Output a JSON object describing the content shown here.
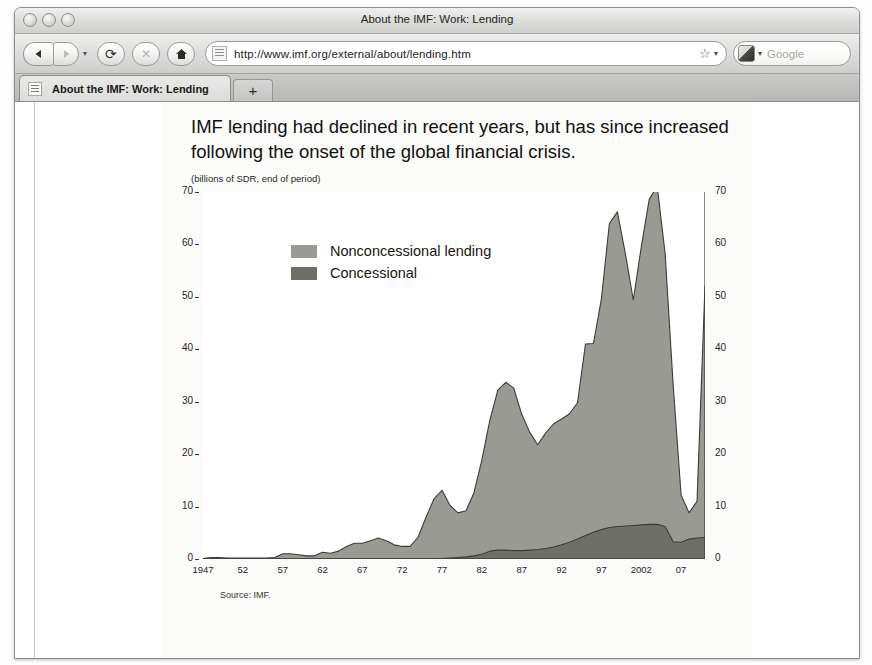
{
  "window": {
    "title": "About the IMF: Work: Lending",
    "buttons": [
      "close",
      "minimize",
      "zoom"
    ]
  },
  "toolbar": {
    "back_icon": "back-arrow-icon",
    "forward_icon": "forward-arrow-icon",
    "history_caret": "▾",
    "reload_label": "⟳",
    "stop_label": "✕",
    "home_label": "⌂",
    "url": "http://www.imf.org/external/about/lending.htm",
    "bookmark_icon": "☆",
    "bookmark_caret": "▾",
    "search_engine_caret": "▾",
    "search_placeholder": "Google"
  },
  "tabs": {
    "active": {
      "label": "About the IMF: Work: Lending"
    },
    "new_tab_label": "+"
  },
  "figure": {
    "title": "IMF lending had declined in recent years, but has since increased following the onset of the global financial crisis.",
    "subtitle": "(billions of SDR, end of period)",
    "source": "Source: IMF."
  },
  "colors": {
    "nonconcessional": "#9a9a95",
    "concessional": "#6f6f6a",
    "outline": "#3d3d38",
    "axis": "#3a3a34",
    "plot_background": "#ffffff",
    "figure_background": "#fbfbfa"
  },
  "chart_data": {
    "type": "area",
    "stacked": true,
    "title": "IMF lending had declined in recent years, but has since increased following the onset of the global financial crisis.",
    "subtitle": "(billions of SDR, end of period)",
    "xlabel": "",
    "ylabel": "billions of SDR, end of period",
    "ylim": [
      0,
      70
    ],
    "yticks": [
      0,
      10,
      20,
      30,
      40,
      50,
      60,
      70
    ],
    "ytick_labels_left": [
      "0",
      "10",
      "20",
      "30",
      "40",
      "50",
      "60",
      "70"
    ],
    "ytick_labels_right": [
      "0",
      "10",
      "20",
      "30",
      "40",
      "50",
      "60",
      "70"
    ],
    "xlim": [
      1947,
      2010
    ],
    "xticks": [
      1947,
      1952,
      1957,
      1962,
      1967,
      1972,
      1977,
      1982,
      1987,
      1992,
      1997,
      2002,
      2007
    ],
    "xtick_labels": [
      "1947",
      "52",
      "57",
      "62",
      "67",
      "72",
      "77",
      "82",
      "87",
      "92",
      "97",
      "2002",
      "07"
    ],
    "minor_tick_interval": 1,
    "grid": false,
    "legend_position": "upper-left-inside",
    "source": "Source: IMF.",
    "x": [
      1947,
      1948,
      1949,
      1950,
      1951,
      1952,
      1953,
      1954,
      1955,
      1956,
      1957,
      1958,
      1959,
      1960,
      1961,
      1962,
      1963,
      1964,
      1965,
      1966,
      1967,
      1968,
      1969,
      1970,
      1971,
      1972,
      1973,
      1974,
      1975,
      1976,
      1977,
      1978,
      1979,
      1980,
      1981,
      1982,
      1983,
      1984,
      1985,
      1986,
      1987,
      1988,
      1989,
      1990,
      1991,
      1992,
      1993,
      1994,
      1995,
      1996,
      1997,
      1998,
      1999,
      2000,
      2001,
      2002,
      2003,
      2004,
      2005,
      2006,
      2007,
      2008,
      2009,
      2010
    ],
    "series": [
      {
        "name": "Concessional",
        "color": "#6f6f6a",
        "values": [
          0,
          0,
          0,
          0,
          0,
          0,
          0,
          0,
          0,
          0,
          0,
          0,
          0,
          0,
          0,
          0,
          0,
          0,
          0,
          0,
          0,
          0,
          0,
          0,
          0,
          0,
          0,
          0,
          0,
          0,
          0.1,
          0.2,
          0.3,
          0.4,
          0.6,
          0.9,
          1.5,
          1.7,
          1.7,
          1.6,
          1.6,
          1.7,
          1.8,
          2.0,
          2.3,
          2.7,
          3.2,
          3.8,
          4.5,
          5.1,
          5.6,
          6.0,
          6.2,
          6.3,
          6.4,
          6.5,
          6.6,
          6.6,
          6.2,
          3.3,
          3.2,
          3.8,
          4.0,
          4.1
        ]
      },
      {
        "name": "Nonconcessional lending",
        "color": "#9a9a95",
        "values": [
          0.1,
          0.3,
          0.3,
          0.2,
          0.2,
          0.2,
          0.2,
          0.2,
          0.2,
          0.3,
          1.0,
          1.0,
          0.8,
          0.6,
          0.6,
          1.3,
          1.1,
          1.5,
          2.4,
          3.0,
          3.0,
          3.5,
          4.0,
          3.5,
          2.7,
          2.4,
          2.4,
          4.2,
          8.0,
          11.5,
          13.0,
          10.0,
          8.5,
          8.8,
          12.0,
          18.0,
          25.0,
          30.5,
          32.0,
          31.0,
          26.0,
          22.5,
          20.0,
          22.0,
          23.5,
          24.0,
          24.5,
          26.0,
          36.5,
          36.0,
          44.0,
          58.0,
          60.0,
          52.0,
          43.0,
          53.0,
          62.0,
          64.5,
          52.0,
          30.0,
          9.0,
          5.0,
          7.0,
          48.0
        ]
      }
    ],
    "legend": [
      {
        "label": "Nonconcessional lending",
        "color": "#9a9a95"
      },
      {
        "label": "Concessional",
        "color": "#6f6f6a"
      }
    ]
  }
}
